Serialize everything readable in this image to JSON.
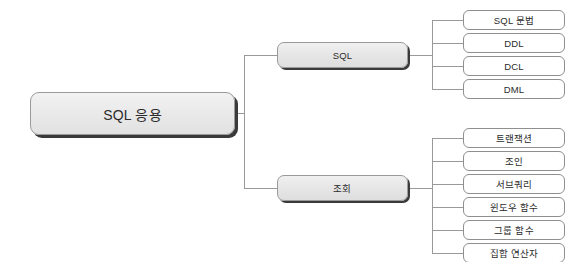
{
  "diagram": {
    "type": "tree-mindmap",
    "orientation": "left-to-right",
    "background_color": "#ffffff",
    "line_color": "#999999",
    "root": {
      "label": "SQL 응용",
      "x": 30,
      "y": 92,
      "w": 205,
      "h": 43
    },
    "branches": [
      {
        "id": "sql",
        "label": "SQL",
        "x": 277,
        "y": 42,
        "w": 131,
        "h": 26,
        "children": [
          {
            "label": "SQL 문법",
            "x": 463,
            "y": 10,
            "w": 102,
            "h": 20
          },
          {
            "label": "DDL",
            "x": 463,
            "y": 33,
            "w": 102,
            "h": 20
          },
          {
            "label": "DCL",
            "x": 463,
            "y": 56,
            "w": 102,
            "h": 20
          },
          {
            "label": "DML",
            "x": 463,
            "y": 79,
            "w": 102,
            "h": 20
          }
        ]
      },
      {
        "id": "query",
        "label": "조회",
        "x": 277,
        "y": 175,
        "w": 131,
        "h": 26,
        "children": [
          {
            "label": "트랜잭션",
            "x": 463,
            "y": 128,
            "w": 102,
            "h": 20
          },
          {
            "label": "조인",
            "x": 463,
            "y": 151,
            "w": 102,
            "h": 20
          },
          {
            "label": "서브쿼리",
            "x": 463,
            "y": 174,
            "w": 102,
            "h": 20
          },
          {
            "label": "윈도우 함수",
            "x": 463,
            "y": 197,
            "w": 102,
            "h": 20
          },
          {
            "label": "그룹 함수",
            "x": 463,
            "y": 220,
            "w": 102,
            "h": 20
          },
          {
            "label": "집합 연산자",
            "x": 463,
            "y": 243,
            "w": 102,
            "h": 20
          }
        ]
      }
    ]
  }
}
